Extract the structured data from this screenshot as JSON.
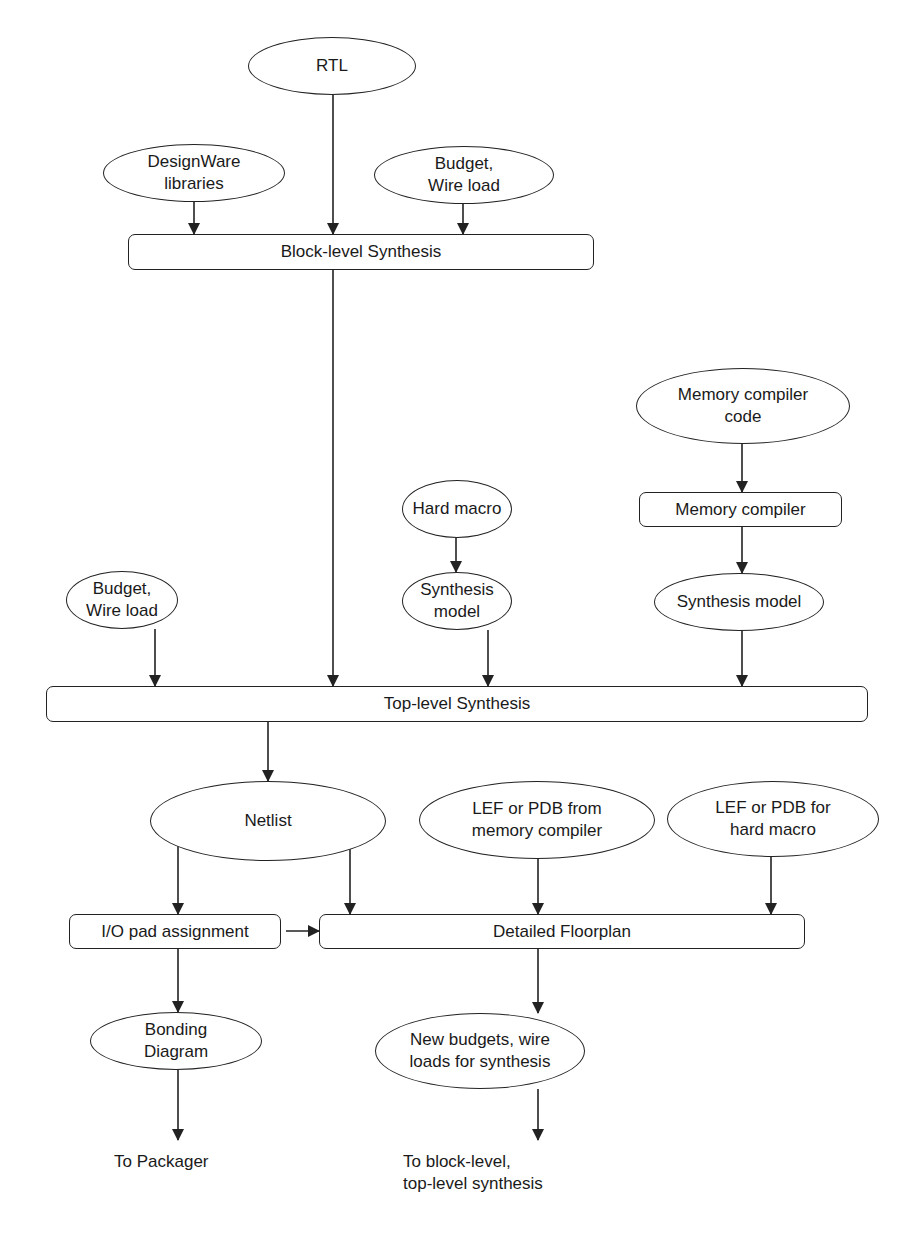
{
  "diagram": {
    "nodes": [
      {
        "id": "rtl",
        "label": "RTL",
        "shape": "ellipse",
        "x": 248,
        "y": 37,
        "w": 168,
        "h": 58
      },
      {
        "id": "designware",
        "label": "DesignWare\nlibraries",
        "shape": "ellipse",
        "x": 103,
        "y": 144,
        "w": 182,
        "h": 58
      },
      {
        "id": "budget_top",
        "label": "Budget,\nWire load",
        "shape": "ellipse",
        "x": 374,
        "y": 146,
        "w": 180,
        "h": 58
      },
      {
        "id": "block_synth",
        "label": "Block-level Synthesis",
        "shape": "box",
        "x": 128,
        "y": 234,
        "w": 466,
        "h": 36
      },
      {
        "id": "mem_code",
        "label": "Memory compiler\ncode",
        "shape": "ellipse",
        "x": 636,
        "y": 368,
        "w": 214,
        "h": 76
      },
      {
        "id": "hard_macro",
        "label": "Hard macro",
        "shape": "ellipse",
        "x": 402,
        "y": 480,
        "w": 110,
        "h": 58
      },
      {
        "id": "mem_compiler",
        "label": "Memory compiler",
        "shape": "box",
        "x": 639,
        "y": 492,
        "w": 203,
        "h": 35
      },
      {
        "id": "budget_mid",
        "label": "Budget,\nWire load",
        "shape": "ellipse",
        "x": 66,
        "y": 571,
        "w": 112,
        "h": 58
      },
      {
        "id": "synth_model_hm",
        "label": "Synthesis\nmodel",
        "shape": "ellipse",
        "x": 402,
        "y": 572,
        "w": 110,
        "h": 58
      },
      {
        "id": "synth_model_mc",
        "label": "Synthesis model",
        "shape": "ellipse",
        "x": 654,
        "y": 573,
        "w": 170,
        "h": 58
      },
      {
        "id": "top_synth",
        "label": "Top-level Synthesis",
        "shape": "box",
        "x": 46,
        "y": 686,
        "w": 822,
        "h": 36
      },
      {
        "id": "netlist",
        "label": "Netlist",
        "shape": "ellipse",
        "x": 150,
        "y": 781,
        "w": 236,
        "h": 80
      },
      {
        "id": "lef_mem",
        "label": "LEF or PDB from\nmemory compiler",
        "shape": "ellipse",
        "x": 419,
        "y": 781,
        "w": 236,
        "h": 78
      },
      {
        "id": "lef_hm",
        "label": "LEF or PDB for\nhard macro",
        "shape": "ellipse",
        "x": 667,
        "y": 781,
        "w": 212,
        "h": 76
      },
      {
        "id": "io_pad",
        "label": "I/O pad assignment",
        "shape": "box",
        "x": 69,
        "y": 914,
        "w": 212,
        "h": 35
      },
      {
        "id": "floorplan",
        "label": "Detailed Floorplan",
        "shape": "box",
        "x": 319,
        "y": 914,
        "w": 486,
        "h": 35
      },
      {
        "id": "bonding",
        "label": "Bonding\nDiagram",
        "shape": "ellipse",
        "x": 90,
        "y": 1012,
        "w": 172,
        "h": 58
      },
      {
        "id": "new_budgets",
        "label": "New budgets, wire\nloads for synthesis",
        "shape": "ellipse",
        "x": 375,
        "y": 1013,
        "w": 210,
        "h": 76
      },
      {
        "id": "to_packager",
        "label": "To Packager",
        "shape": "plain",
        "x": 114,
        "y": 1151,
        "w": 140,
        "h": 22
      },
      {
        "id": "to_block_top",
        "label": "To block-level,\ntop-level synthesis",
        "shape": "plain",
        "x": 403,
        "y": 1151,
        "w": 200,
        "h": 44
      }
    ],
    "edges": [
      {
        "from": "designware",
        "to": "block_synth",
        "x1": 194,
        "y1": 202,
        "x2": 194,
        "y2": 234
      },
      {
        "from": "rtl",
        "to": "block_synth",
        "x1": 333,
        "y1": 95,
        "x2": 333,
        "y2": 234
      },
      {
        "from": "budget_top",
        "to": "block_synth",
        "x1": 463,
        "y1": 204,
        "x2": 463,
        "y2": 234
      },
      {
        "from": "block_synth",
        "to": "top_synth",
        "x1": 333,
        "y1": 270,
        "x2": 333,
        "y2": 686
      },
      {
        "from": "mem_code",
        "to": "mem_compiler",
        "x1": 742,
        "y1": 444,
        "x2": 742,
        "y2": 492
      },
      {
        "from": "mem_compiler",
        "to": "synth_model_mc",
        "x1": 742,
        "y1": 527,
        "x2": 742,
        "y2": 573
      },
      {
        "from": "hard_macro",
        "to": "synth_model_hm",
        "x1": 456,
        "y1": 538,
        "x2": 456,
        "y2": 572
      },
      {
        "from": "budget_mid",
        "to": "top_synth",
        "x1": 155,
        "y1": 629,
        "x2": 155,
        "y2": 686
      },
      {
        "from": "synth_model_hm",
        "to": "top_synth",
        "x1": 488,
        "y1": 630,
        "x2": 488,
        "y2": 686
      },
      {
        "from": "synth_model_mc",
        "to": "top_synth",
        "x1": 742,
        "y1": 631,
        "x2": 742,
        "y2": 686
      },
      {
        "from": "top_synth",
        "to": "netlist",
        "x1": 268,
        "y1": 722,
        "x2": 268,
        "y2": 781
      },
      {
        "from": "netlist",
        "to": "io_pad",
        "x1": 178,
        "y1": 840,
        "x2": 178,
        "y2": 914
      },
      {
        "from": "netlist",
        "to": "floorplan",
        "x1": 350,
        "y1": 845,
        "x2": 350,
        "y2": 914
      },
      {
        "from": "lef_mem",
        "to": "floorplan",
        "x1": 538,
        "y1": 859,
        "x2": 538,
        "y2": 914
      },
      {
        "from": "lef_hm",
        "to": "floorplan",
        "x1": 771,
        "y1": 857,
        "x2": 771,
        "y2": 914
      },
      {
        "from": "io_pad",
        "to": "floorplan",
        "x1": 286,
        "y1": 931,
        "x2": 319,
        "y2": 931
      },
      {
        "from": "io_pad",
        "to": "bonding",
        "x1": 178,
        "y1": 949,
        "x2": 178,
        "y2": 1012
      },
      {
        "from": "floorplan",
        "to": "new_budgets",
        "x1": 538,
        "y1": 949,
        "x2": 538,
        "y2": 1013
      },
      {
        "from": "bonding",
        "to": "to_packager",
        "x1": 178,
        "y1": 1070,
        "x2": 178,
        "y2": 1140
      },
      {
        "from": "new_budgets",
        "to": "to_block_top",
        "x1": 538,
        "y1": 1089,
        "x2": 538,
        "y2": 1140
      }
    ],
    "colors": {
      "stroke": "#222222",
      "fill": "#ffffff",
      "text": "#1a1a1a"
    }
  }
}
